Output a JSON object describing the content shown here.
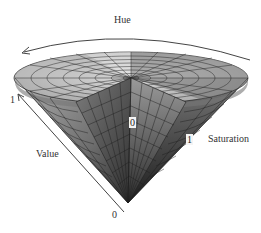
{
  "figure": {
    "labels": {
      "hue": "Hue",
      "value": "Value",
      "saturation": "Saturation",
      "value_max": "1",
      "value_min": "0",
      "saturation_min": "0",
      "saturation_max": "1"
    },
    "colors": {
      "background": "#ffffff",
      "axis_line": "#444444",
      "mesh_line": "#222222",
      "light_face": "#bdbdbd",
      "mid_face": "#8a8a8a",
      "dark_face": "#3a3a3a"
    }
  }
}
